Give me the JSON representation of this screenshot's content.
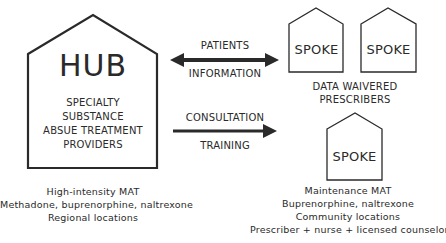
{
  "hub": {
    "title": "HUB",
    "description_lines": [
      "SPECIALTY",
      "SUBSTANCE",
      "ABSUE TREATMENT",
      "PROVIDERS"
    ],
    "caption_lines": [
      "High-intensity MAT",
      "Methadone, buprenorphine, naltrexone",
      "Regional locations"
    ]
  },
  "connections": {
    "bidirectional": {
      "label_above": "PATIENTS",
      "label_below": "INFORMATION",
      "arrow": "double-headed"
    },
    "unidirectional": {
      "label_above": "CONSULTATION",
      "label_below": "TRAINING",
      "arrow": "right"
    }
  },
  "spokes": {
    "top_group": {
      "items": [
        {
          "label": "SPOKE"
        },
        {
          "label": "SPOKE"
        }
      ],
      "caption_lines": [
        "DATA WAIVERED",
        "PRESCRIBERS"
      ]
    },
    "bottom": {
      "label": "SPOKE",
      "caption_lines": [
        "Maintenance MAT",
        "Buprenorphine, naltrexone",
        "Community locations",
        "Prescriber + nurse + licensed counselor"
      ]
    }
  },
  "colors": {
    "stroke": "#2a2a2a",
    "background": "#ffffff"
  }
}
